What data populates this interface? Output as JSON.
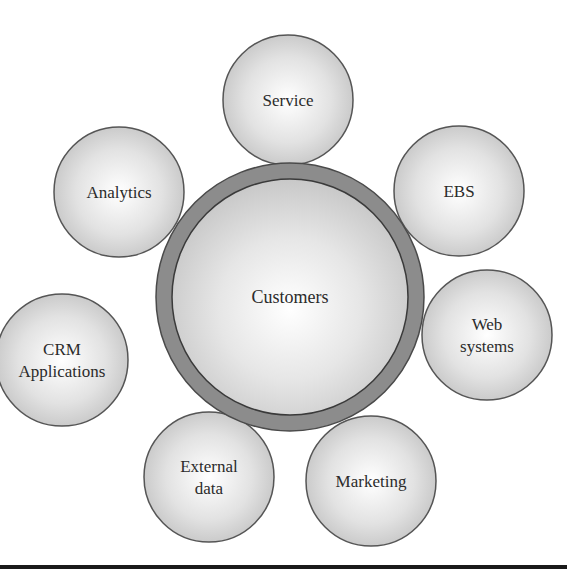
{
  "diagram": {
    "type": "hub-and-spoke",
    "center": {
      "label": "Customers",
      "cx": 290,
      "cy": 297,
      "ring_outer_r": 134,
      "ring_inner_r": 118,
      "ring_color": "#8c8c8c",
      "fill_center": "#ffffff",
      "fill_edge": "#c4c4c4"
    },
    "nodes": [
      {
        "id": "service",
        "lines": [
          "Service"
        ],
        "cx": 288,
        "cy": 100,
        "r": 65
      },
      {
        "id": "ebs",
        "lines": [
          "EBS"
        ],
        "cx": 459,
        "cy": 191,
        "r": 65
      },
      {
        "id": "web-systems",
        "lines": [
          "Web",
          "systems"
        ],
        "cx": 487,
        "cy": 335,
        "r": 65
      },
      {
        "id": "marketing",
        "lines": [
          "Marketing"
        ],
        "cx": 371,
        "cy": 481,
        "r": 65
      },
      {
        "id": "external-data",
        "lines": [
          "External",
          "data"
        ],
        "cx": 209,
        "cy": 477,
        "r": 65
      },
      {
        "id": "crm-applications",
        "lines": [
          "CRM",
          "Applications"
        ],
        "cx": 62,
        "cy": 360,
        "r": 66
      },
      {
        "id": "analytics",
        "lines": [
          "Analytics"
        ],
        "cx": 119,
        "cy": 192,
        "r": 65
      }
    ],
    "node_fill_center": "#ffffff",
    "node_fill_edge": "#c6c6c6",
    "stroke_color": "#555555",
    "text_color": "#2b2b2b",
    "bottom_rule_color": "#1a1a1a"
  }
}
